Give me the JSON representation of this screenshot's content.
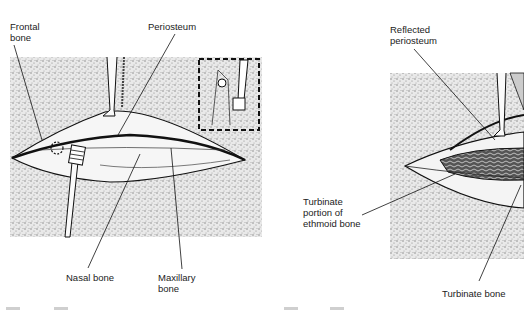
{
  "figures": [
    {
      "id": "left",
      "labels": {
        "frontal_bone": "Frontal\nbone",
        "periosteum": "Periosteum",
        "nasal_bone": "Nasal bone",
        "maxillary_bone": "Maxillary\nbone"
      },
      "inset": "dashed-box detail of instrument"
    },
    {
      "id": "right",
      "labels": {
        "reflected_periosteum": "Reflected\nperiosteum",
        "turbinate_portion": "Turbinate\nportion of\nethmoid bone",
        "turbinate_bone": "Turbinate bone"
      }
    }
  ],
  "colors": {
    "ink": "#1a1a1a",
    "stipple": "#c8c8c8",
    "background": "#ffffff"
  }
}
